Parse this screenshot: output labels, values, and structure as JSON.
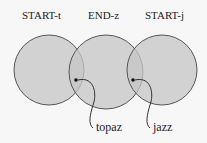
{
  "diagram": {
    "type": "venn",
    "circles": [
      {
        "label": "START-t",
        "cx": 49,
        "cy": 70,
        "r": 35
      },
      {
        "label": "END-z",
        "cx": 106,
        "cy": 72,
        "r": 37
      },
      {
        "label": "START-j",
        "cx": 162,
        "cy": 70,
        "r": 35
      }
    ],
    "points": [
      {
        "label": "topaz",
        "x": 76,
        "y": 80
      },
      {
        "label": "jazz",
        "x": 133,
        "y": 80
      }
    ],
    "colors": {
      "fill": "#c8c8c8",
      "stroke": "#555555",
      "background": "#f7f7f7"
    }
  }
}
